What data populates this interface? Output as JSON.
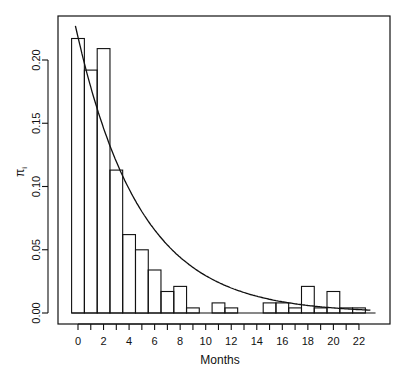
{
  "chart_data": {
    "type": "bar",
    "title": "",
    "xlabel": "Months",
    "ylabel": "π_i",
    "ylabel_main": "π",
    "ylabel_sub": "i",
    "x": [
      0,
      1,
      2,
      3,
      4,
      5,
      6,
      7,
      8,
      9,
      10,
      11,
      12,
      13,
      14,
      15,
      16,
      17,
      18,
      19,
      20,
      21,
      22
    ],
    "values": [
      0.217,
      0.192,
      0.209,
      0.113,
      0.062,
      0.05,
      0.034,
      0.017,
      0.021,
      0.004,
      0.0,
      0.008,
      0.004,
      0.0,
      0.0,
      0.008,
      0.008,
      0.004,
      0.021,
      0.004,
      0.017,
      0.004,
      0.004
    ],
    "x_ticks": [
      0,
      2,
      4,
      6,
      8,
      10,
      12,
      14,
      16,
      18,
      20,
      22
    ],
    "x_minor_ticks": [
      0,
      1,
      2,
      3,
      4,
      5,
      6,
      7,
      8,
      9,
      10,
      11,
      12,
      13,
      14,
      15,
      16,
      17,
      18,
      19,
      20,
      21,
      22
    ],
    "y_ticks": [
      "0.00",
      "0.05",
      "0.10",
      "0.15",
      "0.20"
    ],
    "ylim": [
      0,
      0.23
    ],
    "xlim": [
      -1,
      23.5
    ],
    "grid": false,
    "legend": null,
    "overlay": {
      "type": "line",
      "name": "fitted geometric/exponential curve",
      "description": "decaying curve approx 0.227 * exp(-0.2*x)",
      "a": 0.227,
      "rate": 0.2,
      "x_start": -0.2,
      "x_end": 23
    }
  },
  "colors": {
    "ink": "#111111",
    "background": "#ffffff"
  }
}
